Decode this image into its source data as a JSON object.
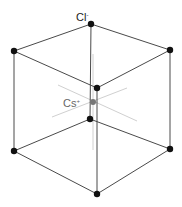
{
  "diagram": {
    "labels": {
      "cl": "Cl",
      "cl_charge": "-",
      "cs": "Cs",
      "cs_charge": "+"
    },
    "colors": {
      "edge": "#444444",
      "vertex": "#111111",
      "center": "#777777",
      "axis": "#cccccc",
      "cs_label": "#666666",
      "cl_label": "#222222"
    },
    "vertices": [
      {
        "id": "top",
        "x": 91,
        "y": 24
      },
      {
        "id": "upper-left",
        "x": 14,
        "y": 51
      },
      {
        "id": "upper-right",
        "x": 170,
        "y": 50
      },
      {
        "id": "inner-top",
        "x": 97,
        "y": 88
      },
      {
        "id": "inner-bottom",
        "x": 90,
        "y": 119
      },
      {
        "id": "lower-left",
        "x": 14,
        "y": 151
      },
      {
        "id": "lower-right",
        "x": 170,
        "y": 149
      },
      {
        "id": "bottom",
        "x": 97,
        "y": 194
      }
    ],
    "center": {
      "x": 93,
      "y": 102
    }
  }
}
